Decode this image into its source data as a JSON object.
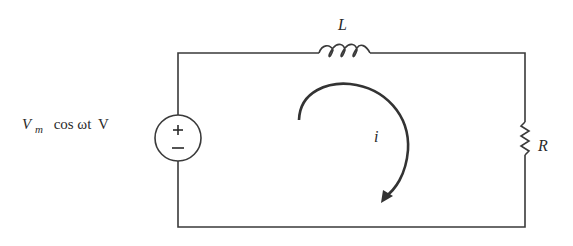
{
  "diagram": {
    "type": "series RL circuit",
    "source": {
      "label_main": "V",
      "label_sub": "m",
      "label_rest": "cos ωt",
      "label_unit": "V",
      "plus": "+",
      "minus": "−"
    },
    "inductor": {
      "label": "L"
    },
    "resistor": {
      "label": "R"
    },
    "current": {
      "label": "i",
      "direction": "clockwise"
    },
    "colors": {
      "wire": "#3a3a3a",
      "text": "#2a2a2a"
    }
  }
}
